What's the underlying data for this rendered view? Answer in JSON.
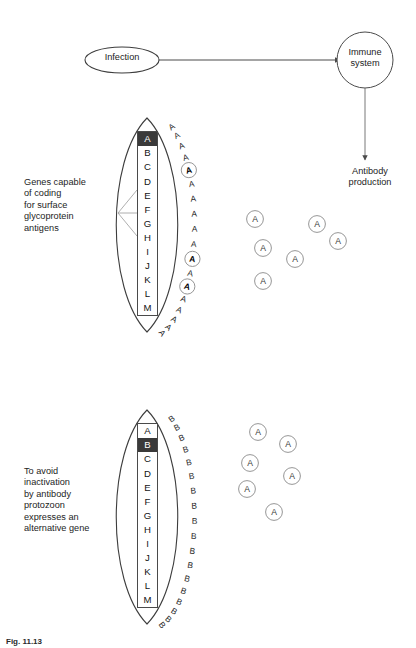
{
  "figure": {
    "caption": "Fig. 11.13"
  },
  "flow": {
    "infection_label": "Infection",
    "immune_label": "Immune\nsystem",
    "antibody_label": "Antibody\nproduction"
  },
  "panels": [
    {
      "id": "panel-1",
      "caption": "Genes capable\nof coding\nfor surface\nglycoprotein\nantigens",
      "genes": [
        "A",
        "B",
        "C",
        "D",
        "E",
        "F",
        "G",
        "H",
        "I",
        "J",
        "K",
        "L",
        "M"
      ],
      "active_gene": "A",
      "surface_antigen_letter": "A",
      "surface_antigens": [
        {
          "letter": "A",
          "angle": -62,
          "bound": false
        },
        {
          "letter": "A",
          "angle": -54,
          "bound": false
        },
        {
          "letter": "A",
          "angle": -46,
          "bound": false
        },
        {
          "letter": "A",
          "angle": -38,
          "bound": false
        },
        {
          "letter": "A",
          "angle": -30,
          "bound": true
        },
        {
          "letter": "A",
          "angle": -22,
          "bound": false
        },
        {
          "letter": "A",
          "angle": -14,
          "bound": false
        },
        {
          "letter": "A",
          "angle": -6,
          "bound": false
        },
        {
          "letter": "A",
          "angle": 2,
          "bound": false
        },
        {
          "letter": "A",
          "angle": 10,
          "bound": false
        },
        {
          "letter": "A",
          "angle": 18,
          "bound": true
        },
        {
          "letter": "A",
          "angle": 26,
          "bound": false
        },
        {
          "letter": "A",
          "angle": 34,
          "bound": true
        },
        {
          "letter": "A",
          "angle": 42,
          "bound": false
        },
        {
          "letter": "A",
          "angle": 50,
          "bound": false
        },
        {
          "letter": "A",
          "angle": 58,
          "bound": false
        },
        {
          "letter": "A",
          "angle": 66,
          "bound": false
        },
        {
          "letter": "A",
          "angle": 74,
          "bound": false
        }
      ],
      "free_antibodies": [
        {
          "letter": "A",
          "x": 255,
          "y": 219
        },
        {
          "letter": "A",
          "x": 263,
          "y": 248
        },
        {
          "letter": "A",
          "x": 263,
          "y": 281
        },
        {
          "letter": "A",
          "x": 295,
          "y": 259
        },
        {
          "letter": "A",
          "x": 317,
          "y": 224
        },
        {
          "letter": "A",
          "x": 338,
          "y": 241
        }
      ]
    },
    {
      "id": "panel-2",
      "caption": "To avoid\ninactivation\nby antibody\nprotozoon\nexpresses an\nalternative gene",
      "genes": [
        "A",
        "B",
        "C",
        "D",
        "E",
        "F",
        "G",
        "H",
        "I",
        "J",
        "K",
        "L",
        "M"
      ],
      "active_gene": "B",
      "surface_antigen_letter": "B",
      "surface_antigens": [
        {
          "letter": "B",
          "angle": -62,
          "bound": false
        },
        {
          "letter": "B",
          "angle": -54,
          "bound": false
        },
        {
          "letter": "B",
          "angle": -46,
          "bound": false
        },
        {
          "letter": "B",
          "angle": -38,
          "bound": false
        },
        {
          "letter": "B",
          "angle": -30,
          "bound": false
        },
        {
          "letter": "B",
          "angle": -22,
          "bound": false
        },
        {
          "letter": "B",
          "angle": -14,
          "bound": false
        },
        {
          "letter": "B",
          "angle": -6,
          "bound": false
        },
        {
          "letter": "B",
          "angle": 2,
          "bound": false
        },
        {
          "letter": "B",
          "angle": 10,
          "bound": false
        },
        {
          "letter": "B",
          "angle": 18,
          "bound": false
        },
        {
          "letter": "B",
          "angle": 26,
          "bound": false
        },
        {
          "letter": "B",
          "angle": 34,
          "bound": false
        },
        {
          "letter": "B",
          "angle": 42,
          "bound": false
        },
        {
          "letter": "B",
          "angle": 50,
          "bound": false
        },
        {
          "letter": "B",
          "angle": 58,
          "bound": false
        },
        {
          "letter": "B",
          "angle": 66,
          "bound": false
        },
        {
          "letter": "B",
          "angle": 74,
          "bound": false
        }
      ],
      "free_antibodies": [
        {
          "letter": "A",
          "x": 258,
          "y": 432
        },
        {
          "letter": "A",
          "x": 288,
          "y": 444
        },
        {
          "letter": "A",
          "x": 250,
          "y": 463
        },
        {
          "letter": "A",
          "x": 292,
          "y": 476
        },
        {
          "letter": "A",
          "x": 247,
          "y": 489
        },
        {
          "letter": "A",
          "x": 274,
          "y": 512
        }
      ]
    }
  ],
  "colors": {
    "line": "#4a4a4a",
    "antibody_ring": "#8a8a8a",
    "active_gene_bg": "#3a3a3a",
    "text": "#1a1a1a"
  }
}
